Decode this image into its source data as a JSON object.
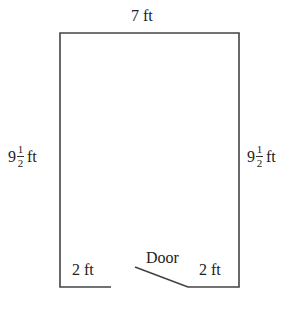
{
  "diagram": {
    "top_label": "7 ft",
    "left_label": {
      "whole": "9",
      "num": "1",
      "den": "2",
      "unit": "ft"
    },
    "right_label": {
      "whole": "9",
      "num": "1",
      "den": "2",
      "unit": "ft"
    },
    "bottom_left_label": "2 ft",
    "bottom_right_label": "2 ft",
    "door_label": "Door",
    "line_color": "#444444"
  }
}
